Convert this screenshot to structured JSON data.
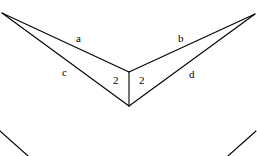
{
  "figure": {
    "background_color": "#ffffff",
    "stroke_color": "#000000",
    "canvas": {
      "width": 257,
      "height": 156
    },
    "vertices": {
      "left": {
        "name": "left-vertex",
        "x": 2,
        "y": 13
      },
      "right": {
        "name": "right-vertex",
        "x": 255,
        "y": 14
      },
      "center_top": {
        "name": "center-top-vertex",
        "x": 129,
        "y": 72
      },
      "center_bottom": {
        "name": "center-bottom-vertex",
        "x": 129,
        "y": 106
      }
    },
    "segments": [
      {
        "name": "segment-a",
        "label": "a",
        "from": "left",
        "to": "center_top"
      },
      {
        "name": "segment-b",
        "label": "b",
        "from": "right",
        "to": "center_top"
      },
      {
        "name": "segment-c",
        "label": "c",
        "from": "left",
        "to": "center_bottom"
      },
      {
        "name": "segment-d",
        "label": "d",
        "from": "right",
        "to": "center_bottom"
      },
      {
        "name": "segment-vertical",
        "label": "",
        "from": "center_top",
        "to": "center_bottom"
      }
    ],
    "labels": {
      "a": "a",
      "b": "b",
      "c": "c",
      "d": "d",
      "angle_left": "2",
      "angle_right": "2"
    },
    "partial_lines_below": [
      {
        "name": "partial-line-left",
        "x1": 0,
        "y1": 131,
        "x2": 28,
        "y2": 156
      },
      {
        "name": "partial-line-right",
        "x1": 256,
        "y1": 131,
        "x2": 228,
        "y2": 156
      }
    ]
  }
}
